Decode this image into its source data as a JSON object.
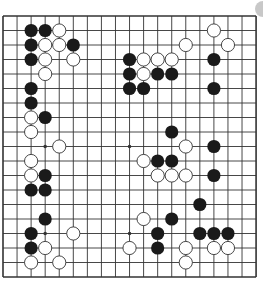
{
  "board": {
    "size": 19,
    "origin": [
      3,
      16
    ],
    "spacing": [
      14.06,
      14.5
    ],
    "stone_radius": 6.6,
    "colors": {
      "line": "#333333",
      "black": "#1a1a1a",
      "white": "#ffffff",
      "white_stroke": "#333333",
      "background": "#ffffff"
    },
    "star_points": [
      [
        3,
        3
      ],
      [
        9,
        3
      ],
      [
        15,
        3
      ],
      [
        3,
        9
      ],
      [
        9,
        9
      ],
      [
        15,
        9
      ],
      [
        3,
        15
      ],
      [
        9,
        15
      ],
      [
        15,
        15
      ]
    ],
    "stones": [
      {
        "c": "B",
        "x": 2,
        "y": 1
      },
      {
        "c": "B",
        "x": 3,
        "y": 1
      },
      {
        "c": "W",
        "x": 4,
        "y": 1
      },
      {
        "c": "B",
        "x": 2,
        "y": 2
      },
      {
        "c": "W",
        "x": 3,
        "y": 2
      },
      {
        "c": "W",
        "x": 4,
        "y": 2
      },
      {
        "c": "B",
        "x": 5,
        "y": 2
      },
      {
        "c": "B",
        "x": 2,
        "y": 3
      },
      {
        "c": "W",
        "x": 3,
        "y": 3
      },
      {
        "c": "W",
        "x": 5,
        "y": 3
      },
      {
        "c": "W",
        "x": 3,
        "y": 4
      },
      {
        "c": "B",
        "x": 2,
        "y": 5
      },
      {
        "c": "B",
        "x": 2,
        "y": 6
      },
      {
        "c": "W",
        "x": 2,
        "y": 7
      },
      {
        "c": "B",
        "x": 3,
        "y": 7
      },
      {
        "c": "W",
        "x": 2,
        "y": 8
      },
      {
        "c": "W",
        "x": 4,
        "y": 9
      },
      {
        "c": "W",
        "x": 2,
        "y": 10
      },
      {
        "c": "W",
        "x": 2,
        "y": 11
      },
      {
        "c": "B",
        "x": 3,
        "y": 11
      },
      {
        "c": "B",
        "x": 2,
        "y": 12
      },
      {
        "c": "B",
        "x": 3,
        "y": 12
      },
      {
        "c": "B",
        "x": 3,
        "y": 14
      },
      {
        "c": "B",
        "x": 2,
        "y": 15
      },
      {
        "c": "W",
        "x": 5,
        "y": 15
      },
      {
        "c": "B",
        "x": 2,
        "y": 16
      },
      {
        "c": "W",
        "x": 3,
        "y": 16
      },
      {
        "c": "W",
        "x": 2,
        "y": 17
      },
      {
        "c": "W",
        "x": 4,
        "y": 17
      },
      {
        "c": "W",
        "x": 15,
        "y": 1
      },
      {
        "c": "W",
        "x": 13,
        "y": 2
      },
      {
        "c": "W",
        "x": 16,
        "y": 2
      },
      {
        "c": "B",
        "x": 9,
        "y": 3
      },
      {
        "c": "W",
        "x": 10,
        "y": 3
      },
      {
        "c": "W",
        "x": 11,
        "y": 3
      },
      {
        "c": "W",
        "x": 12,
        "y": 3
      },
      {
        "c": "B",
        "x": 15,
        "y": 3
      },
      {
        "c": "B",
        "x": 9,
        "y": 4
      },
      {
        "c": "W",
        "x": 10,
        "y": 4
      },
      {
        "c": "B",
        "x": 11,
        "y": 4
      },
      {
        "c": "B",
        "x": 12,
        "y": 4
      },
      {
        "c": "B",
        "x": 9,
        "y": 5
      },
      {
        "c": "B",
        "x": 10,
        "y": 5
      },
      {
        "c": "B",
        "x": 15,
        "y": 5
      },
      {
        "c": "B",
        "x": 12,
        "y": 8
      },
      {
        "c": "W",
        "x": 13,
        "y": 9
      },
      {
        "c": "B",
        "x": 15,
        "y": 9
      },
      {
        "c": "W",
        "x": 10,
        "y": 10
      },
      {
        "c": "B",
        "x": 11,
        "y": 10
      },
      {
        "c": "B",
        "x": 12,
        "y": 10
      },
      {
        "c": "W",
        "x": 11,
        "y": 11
      },
      {
        "c": "W",
        "x": 12,
        "y": 11
      },
      {
        "c": "W",
        "x": 13,
        "y": 11
      },
      {
        "c": "B",
        "x": 15,
        "y": 11
      },
      {
        "c": "B",
        "x": 14,
        "y": 13
      },
      {
        "c": "W",
        "x": 10,
        "y": 14
      },
      {
        "c": "B",
        "x": 12,
        "y": 14
      },
      {
        "c": "B",
        "x": 11,
        "y": 15
      },
      {
        "c": "B",
        "x": 14,
        "y": 15
      },
      {
        "c": "B",
        "x": 15,
        "y": 15
      },
      {
        "c": "B",
        "x": 16,
        "y": 15
      },
      {
        "c": "W",
        "x": 9,
        "y": 16
      },
      {
        "c": "B",
        "x": 11,
        "y": 16
      },
      {
        "c": "W",
        "x": 13,
        "y": 16
      },
      {
        "c": "W",
        "x": 15,
        "y": 16
      },
      {
        "c": "W",
        "x": 16,
        "y": 16
      },
      {
        "c": "W",
        "x": 13,
        "y": 17
      }
    ]
  },
  "ui": {
    "corner_button": "circle-button"
  }
}
